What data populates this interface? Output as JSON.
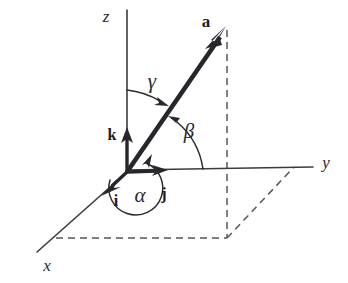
{
  "figure": {
    "background_color": "#ffffff",
    "ink_color": "#26262c",
    "dash_color": "#55555d",
    "width": 348,
    "height": 283
  },
  "axes": {
    "z": {
      "label": "z",
      "icon": "axis-z",
      "tip": [
        127,
        10
      ],
      "origin": [
        127,
        172
      ]
    },
    "y": {
      "label": "y",
      "icon": "axis-y",
      "tip": [
        313,
        167
      ],
      "origin": [
        127,
        170
      ]
    },
    "x": {
      "label": "x",
      "icon": "axis-x",
      "tip": [
        37,
        252
      ],
      "origin": [
        127,
        172
      ]
    }
  },
  "vectors": {
    "a": {
      "label": "a",
      "icon": "vector-arrow-a",
      "from": [
        127,
        172
      ],
      "to": [
        226,
        28
      ]
    },
    "i": {
      "label": "i",
      "icon": "unit-vector-i",
      "from": [
        127,
        172
      ],
      "to": [
        104,
        193
      ]
    },
    "j": {
      "label": "j",
      "icon": "unit-vector-j",
      "from": [
        127,
        172
      ],
      "to": [
        166,
        170
      ]
    },
    "k": {
      "label": "k",
      "icon": "unit-vector-k",
      "from": [
        127,
        172
      ],
      "to": [
        127,
        130
      ]
    }
  },
  "angles": {
    "alpha": {
      "label": "α",
      "icon": "angle-arc-alpha",
      "between": "x-axis and a"
    },
    "beta": {
      "label": "β",
      "icon": "angle-arc-beta",
      "between": "y-axis and a"
    },
    "gamma": {
      "label": "γ",
      "icon": "angle-arc-gamma",
      "between": "z-axis and a"
    }
  },
  "projection": {
    "vertical_dashed": {
      "icon": "dashed-projection-vertical",
      "from": [
        227,
        30
      ],
      "to": [
        227,
        238
      ]
    },
    "horizontal_dashed": {
      "icon": "dashed-projection-horizontal",
      "from": [
        56,
        238
      ],
      "to": [
        227,
        238
      ]
    },
    "diagonal_dashed": {
      "icon": "dashed-projection-diagonal",
      "from": [
        227,
        238
      ],
      "to": [
        294,
        167
      ]
    }
  }
}
